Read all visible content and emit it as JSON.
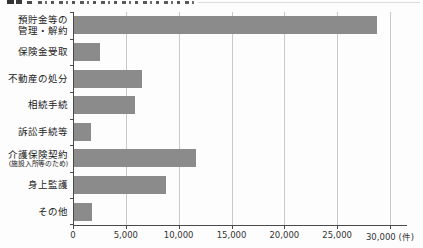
{
  "figure": {
    "title_note": "図の見出し行は上端で切れており判読不能（黒い見出しマーカーと罫線のみ視認可）"
  },
  "chart_data": {
    "type": "bar",
    "orientation": "horizontal",
    "title": "",
    "xlabel": "",
    "ylabel": "",
    "unit": "件",
    "categories": [
      "預貯金等の管理・解約",
      "保険金受取",
      "不動産の処分",
      "相続手続",
      "訴訟手続等",
      "介護保険契約（施設入所等のため）",
      "身上監護",
      "その他"
    ],
    "category_lines": [
      [
        "預貯金等の",
        "管理・解約"
      ],
      [
        "保険金受取"
      ],
      [
        "不動産の処分"
      ],
      [
        "相続手続"
      ],
      [
        "訴訟手続等"
      ],
      [
        "介護保険契約",
        "(施設入所等のため)"
      ],
      [
        "身上監護"
      ],
      [
        "その他"
      ]
    ],
    "values": [
      28800,
      2600,
      6500,
      5900,
      1700,
      11600,
      8800,
      1800
    ],
    "xlim": [
      0,
      30000
    ],
    "x_ticks": [
      0,
      5000,
      10000,
      15000,
      20000,
      25000,
      30000
    ],
    "x_tick_labels": [
      "0",
      "5,000",
      "10,000",
      "15,000",
      "20,000",
      "25,000",
      "30,000 (件)"
    ],
    "grid": true,
    "legend": false,
    "colors": {
      "bar": "#8b8b8b",
      "gridline": "#c9c9c9",
      "axis": "#4a4a4a",
      "label": "#222222",
      "tick_label": "#333333"
    }
  }
}
